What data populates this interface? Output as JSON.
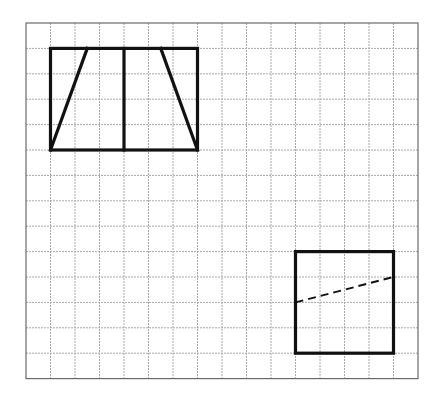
{
  "diagram": {
    "type": "grid-figures",
    "grid": {
      "origin_px": [
        26,
        23
      ],
      "cell_w_px": 24.5,
      "cell_h_px": 25.4,
      "cols": 16,
      "rows": 14,
      "line_color": "#a8a8a8",
      "border_color": "#6a6a6a"
    },
    "figures": [
      {
        "name": "rectangle-with-trapezoid",
        "description": "Rectangle 6x4 cells split by a vertical center line, with two slanted lines forming a trapezoid",
        "rect": {
          "col": 1,
          "row": 1,
          "w": 6,
          "h": 4
        },
        "lines": [
          {
            "name": "center-vertical",
            "from": [
              4,
              1
            ],
            "to": [
              4,
              5
            ],
            "style": "solid"
          },
          {
            "name": "left-diagonal",
            "from": [
              2.5,
              1
            ],
            "to": [
              1,
              5
            ],
            "style": "solid"
          },
          {
            "name": "right-diagonal",
            "from": [
              5.5,
              1
            ],
            "to": [
              7,
              5
            ],
            "style": "solid"
          }
        ]
      },
      {
        "name": "square-with-dashed-cut",
        "description": "Square 4x4 cells with a dashed line from left side to right side",
        "rect": {
          "col": 11,
          "row": 9,
          "w": 4,
          "h": 4
        },
        "lines": [
          {
            "name": "dashed-cut",
            "from": [
              11,
              11
            ],
            "to": [
              15,
              10
            ],
            "style": "dashed"
          }
        ]
      }
    ],
    "colors": {
      "figure_stroke": "#111111",
      "background": "#ffffff"
    }
  }
}
